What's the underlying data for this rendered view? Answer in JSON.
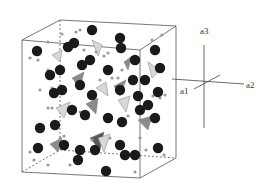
{
  "diagram": {
    "type": "crystal-structure-unit-cell",
    "axes": {
      "a1": "a1",
      "a2": "a2",
      "a3": "a3"
    },
    "colors": {
      "cell_edge": "#555555",
      "large_atom": "#1a1a1a",
      "small_atom": "#9a9a9a",
      "polyhedron_light": "#d8d8d8",
      "polyhedron_mid": "#8c8c8c",
      "polyhedron_dark": "#5a5a5a"
    },
    "large_atoms": [
      [
        92,
        30
      ],
      [
        37,
        51
      ],
      [
        68,
        47
      ],
      [
        74,
        43
      ],
      [
        120,
        38
      ],
      [
        121,
        48
      ],
      [
        135,
        60
      ],
      [
        155,
        50
      ],
      [
        160,
        68
      ],
      [
        50,
        75
      ],
      [
        60,
        70
      ],
      [
        82,
        65
      ],
      [
        90,
        60
      ],
      [
        108,
        70
      ],
      [
        133,
        80
      ],
      [
        145,
        80
      ],
      [
        54,
        93
      ],
      [
        62,
        90
      ],
      [
        80,
        85
      ],
      [
        92,
        95
      ],
      [
        120,
        90
      ],
      [
        138,
        96
      ],
      [
        148,
        105
      ],
      [
        158,
        92
      ],
      [
        40,
        128
      ],
      [
        55,
        125
      ],
      [
        72,
        110
      ],
      [
        85,
        115
      ],
      [
        108,
        118
      ],
      [
        122,
        122
      ],
      [
        140,
        110
      ],
      [
        155,
        118
      ],
      [
        38,
        148
      ],
      [
        64,
        145
      ],
      [
        80,
        150
      ],
      [
        95,
        150
      ],
      [
        120,
        145
      ],
      [
        125,
        155
      ],
      [
        135,
        155
      ],
      [
        158,
        148
      ],
      [
        78,
        160
      ],
      [
        106,
        171
      ]
    ],
    "small_atoms": [
      [
        62,
        34
      ],
      [
        76,
        32
      ],
      [
        80,
        30
      ],
      [
        152,
        40
      ],
      [
        162,
        35
      ],
      [
        30,
        58
      ],
      [
        48,
        42
      ],
      [
        84,
        50
      ],
      [
        96,
        52
      ],
      [
        104,
        56
      ],
      [
        108,
        53
      ],
      [
        38,
        60
      ],
      [
        48,
        70
      ],
      [
        40,
        90
      ],
      [
        52,
        88
      ],
      [
        100,
        80
      ],
      [
        112,
        78
      ],
      [
        118,
        78
      ],
      [
        122,
        70
      ],
      [
        153,
        96
      ],
      [
        160,
        98
      ],
      [
        165,
        95
      ],
      [
        48,
        108
      ],
      [
        52,
        108
      ],
      [
        80,
        112
      ],
      [
        88,
        118
      ],
      [
        128,
        116
      ],
      [
        152,
        120
      ],
      [
        30,
        152
      ],
      [
        34,
        160
      ],
      [
        60,
        138
      ],
      [
        64,
        136
      ],
      [
        70,
        165
      ],
      [
        92,
        140
      ],
      [
        110,
        138
      ],
      [
        140,
        138
      ],
      [
        146,
        150
      ],
      [
        164,
        155
      ],
      [
        48,
        165
      ],
      [
        135,
        172
      ]
    ],
    "polyhedra": [
      {
        "points": "52,55 62,50 60,62",
        "shade": "light"
      },
      {
        "points": "92,40 102,45 98,56",
        "shade": "light"
      },
      {
        "points": "124,62 132,56 128,70",
        "shade": "mid"
      },
      {
        "points": "148,62 160,70 152,78",
        "shade": "light"
      },
      {
        "points": "72,78 84,72 80,88",
        "shade": "mid"
      },
      {
        "points": "96,88 106,82 108,96",
        "shade": "light"
      },
      {
        "points": "114,86 126,80 120,96",
        "shade": "mid"
      },
      {
        "points": "56,108 70,102 64,118",
        "shade": "light"
      },
      {
        "points": "86,104 98,98 96,114",
        "shade": "mid"
      },
      {
        "points": "118,100 130,96 126,112",
        "shade": "light"
      },
      {
        "points": "138,120 152,116 148,130",
        "shade": "mid"
      },
      {
        "points": "50,144 62,138 58,152",
        "shade": "mid"
      },
      {
        "points": "90,138 104,132 100,150",
        "shade": "dark"
      },
      {
        "points": "98,138 110,134 104,152",
        "shade": "light"
      }
    ]
  }
}
